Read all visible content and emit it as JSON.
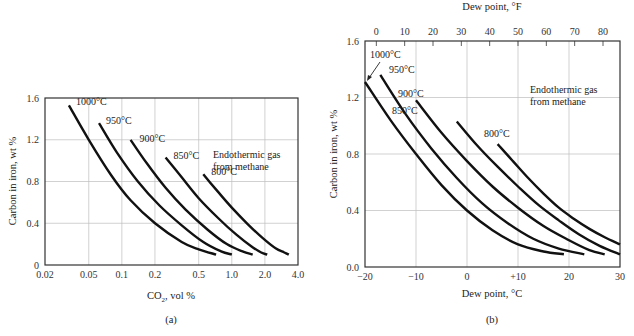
{
  "chart_data": [
    {
      "panel": "(a)",
      "type": "line",
      "title": "",
      "xlabel": "CO₂, vol %",
      "ylabel": "Carbon in iron, wt %",
      "xscale": "log",
      "xlim": [
        0.02,
        4.0
      ],
      "ylim": [
        0,
        1.6
      ],
      "xticks": [
        "0.02",
        "0.05",
        "0.1",
        "0.2",
        "0.5",
        "1.0",
        "2.0",
        "4.0"
      ],
      "xtick_values": [
        0.02,
        0.05,
        0.1,
        0.2,
        0.5,
        1.0,
        2.0,
        4.0
      ],
      "yticks": [
        "0",
        "0.4",
        "0.8",
        "1.2",
        "1.6"
      ],
      "ytick_values": [
        0,
        0.4,
        0.8,
        1.2,
        1.6
      ],
      "grid": true,
      "annotation": [
        "Endothermic gas",
        "from methane"
      ],
      "series": [
        {
          "name": "1000°C",
          "x": [
            0.033,
            0.05,
            0.08,
            0.12,
            0.2,
            0.35,
            0.5,
            0.72
          ],
          "y": [
            1.53,
            1.2,
            0.86,
            0.62,
            0.4,
            0.22,
            0.15,
            0.1
          ]
        },
        {
          "name": "950°C",
          "x": [
            0.062,
            0.09,
            0.14,
            0.22,
            0.35,
            0.55,
            0.8,
            1.0
          ],
          "y": [
            1.36,
            1.08,
            0.8,
            0.57,
            0.38,
            0.22,
            0.13,
            0.1
          ]
        },
        {
          "name": "900°C",
          "x": [
            0.12,
            0.17,
            0.25,
            0.38,
            0.6,
            0.9,
            1.25,
            1.55
          ],
          "y": [
            1.2,
            0.97,
            0.74,
            0.53,
            0.34,
            0.2,
            0.13,
            0.1
          ]
        },
        {
          "name": "850°C",
          "x": [
            0.25,
            0.35,
            0.5,
            0.75,
            1.1,
            1.5,
            1.85,
            2.1
          ],
          "y": [
            1.03,
            0.84,
            0.64,
            0.45,
            0.29,
            0.18,
            0.12,
            0.1
          ]
        },
        {
          "name": "800°C",
          "x": [
            0.55,
            0.75,
            1.0,
            1.4,
            1.9,
            2.5,
            3.0,
            3.3
          ],
          "y": [
            0.87,
            0.7,
            0.55,
            0.39,
            0.26,
            0.16,
            0.12,
            0.1
          ]
        }
      ]
    },
    {
      "panel": "(b)",
      "type": "line",
      "title": "",
      "xlabel": "Dew point, °C",
      "x2label": "Dew point, °F",
      "ylabel": "Carbon in iron, wt %",
      "xlim": [
        -20,
        30
      ],
      "ylim": [
        0.0,
        1.6
      ],
      "xticks": [
        "−20",
        "−10",
        "0",
        "+10",
        "20",
        "30"
      ],
      "xtick_values": [
        -20,
        -10,
        0,
        10,
        20,
        30
      ],
      "x2ticks": [
        "0",
        "10",
        "20",
        "30",
        "40",
        "50",
        "60",
        "70",
        "80"
      ],
      "x2tick_values": [
        0,
        10,
        20,
        30,
        40,
        50,
        60,
        70,
        80
      ],
      "yticks": [
        "0.0",
        "0.4",
        "0.8",
        "1.2",
        "1.6"
      ],
      "ytick_values": [
        0.0,
        0.4,
        0.8,
        1.2,
        1.6
      ],
      "grid": true,
      "annotation": [
        "Endothermic gas",
        "from methane"
      ],
      "series": [
        {
          "name": "1000°C",
          "x": [
            -20,
            -15,
            -10,
            -5,
            0,
            5,
            10,
            15,
            19
          ],
          "y": [
            1.31,
            1.04,
            0.8,
            0.58,
            0.4,
            0.26,
            0.16,
            0.11,
            0.09
          ]
        },
        {
          "name": "950°C",
          "x": [
            -17,
            -12,
            -7,
            -2,
            3,
            8,
            13,
            18,
            23
          ],
          "y": [
            1.36,
            1.08,
            0.84,
            0.63,
            0.45,
            0.31,
            0.2,
            0.13,
            0.09
          ]
        },
        {
          "name": "900°C",
          "x": [
            -10,
            -5,
            0,
            5,
            10,
            15,
            20,
            24,
            27
          ],
          "y": [
            1.18,
            0.95,
            0.75,
            0.57,
            0.42,
            0.29,
            0.19,
            0.12,
            0.09
          ]
        },
        {
          "name": "850°C",
          "x": [
            -2,
            2,
            6,
            10,
            14,
            18,
            22,
            26,
            30
          ],
          "y": [
            1.03,
            0.86,
            0.71,
            0.57,
            0.44,
            0.33,
            0.23,
            0.15,
            0.09
          ]
        },
        {
          "name": "800°C",
          "x": [
            6,
            9,
            12,
            15,
            18,
            21,
            24,
            27,
            30
          ],
          "y": [
            0.87,
            0.75,
            0.63,
            0.52,
            0.42,
            0.34,
            0.27,
            0.21,
            0.16
          ]
        }
      ]
    }
  ],
  "panels": {
    "a": {
      "caption": "(a)",
      "xlabel_main": "CO",
      "xlabel_sub": "2",
      "xlabel_rest": ", vol %",
      "ylabel": "Carbon in iron, wt %",
      "annotation_line1": "Endothermic gas",
      "annotation_line2": "from methane",
      "curve_labels": [
        "1000°C",
        "950°C",
        "900°C",
        "850°C",
        "800°C"
      ]
    },
    "b": {
      "caption": "(b)",
      "xlabel": "Dew point, °C",
      "x2label": "Dew point, °F",
      "ylabel": "Carbon in iron, wt %",
      "annotation_line1": "Endothermic gas",
      "annotation_line2": "from methane",
      "curve_labels": [
        "1000°C",
        "950°C",
        "900°C",
        "850°C",
        "800°C"
      ]
    }
  }
}
